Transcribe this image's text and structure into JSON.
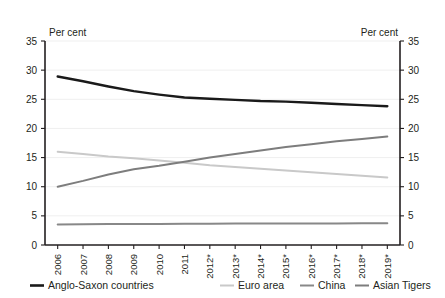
{
  "chart_data": {
    "type": "line",
    "title": "",
    "subtitle": "",
    "xlabel": "",
    "ylabel": "Per cent",
    "ylabel_right": "Per cent",
    "ylim": [
      0,
      35
    ],
    "ytick_values": [
      0,
      5,
      10,
      15,
      20,
      25,
      30,
      35
    ],
    "ytick_labels": [
      "0",
      "5",
      "10",
      "15",
      "20",
      "25",
      "30",
      "35"
    ],
    "ytick_labels_right": [
      "0",
      "5",
      "10",
      "15",
      "20",
      "25",
      "30",
      "35"
    ],
    "grid": true,
    "legend_position": "bottom",
    "categories": [
      "2006",
      "2007",
      "2008",
      "2009",
      "2010",
      "2011",
      "2012*",
      "2013*",
      "2014*",
      "2015*",
      "2016*",
      "2017*",
      "2018*",
      "2019*"
    ],
    "series": [
      {
        "name": "Anglo-Saxon countries",
        "color": "#1a1a1a",
        "width": 2.4,
        "values": [
          28.9,
          28.1,
          27.2,
          26.4,
          25.8,
          25.3,
          25.1,
          24.9,
          24.7,
          24.6,
          24.4,
          24.2,
          24.0,
          23.8
        ]
      },
      {
        "name": "Euro area",
        "color": "#c9c9c9",
        "width": 2.0,
        "values": [
          16.0,
          15.6,
          15.2,
          14.9,
          14.5,
          14.1,
          13.7,
          13.4,
          13.1,
          12.8,
          12.5,
          12.2,
          11.9,
          11.6
        ]
      },
      {
        "name": "China",
        "color": "#888888",
        "width": 2.0,
        "values": [
          3.5,
          3.55,
          3.6,
          3.6,
          3.62,
          3.65,
          3.65,
          3.67,
          3.68,
          3.7,
          3.7,
          3.7,
          3.72,
          3.72
        ]
      },
      {
        "name": "Asian Tigers",
        "color": "#7d7d7d",
        "width": 2.0,
        "values": [
          10.0,
          11.0,
          12.1,
          13.0,
          13.6,
          14.3,
          15.0,
          15.6,
          16.2,
          16.8,
          17.3,
          17.8,
          18.2,
          18.6
        ]
      }
    ],
    "legend": [
      {
        "label": "Anglo-Saxon countries",
        "color": "#1a1a1a"
      },
      {
        "label": "Euro area",
        "color": "#c9c9c9"
      },
      {
        "label": "China",
        "color": "#888888"
      },
      {
        "label": "Asian Tigers",
        "color": "#7d7d7d"
      }
    ]
  }
}
